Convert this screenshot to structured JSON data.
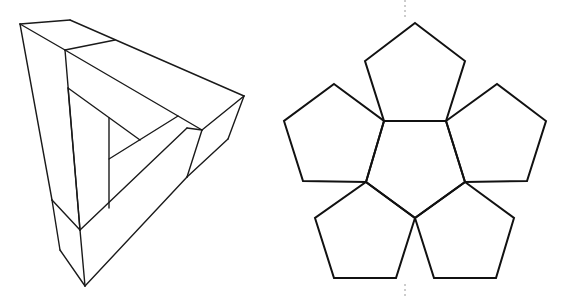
{
  "figure": {
    "width": 569,
    "height": 296,
    "line_color": "#1a1a1a",
    "background": "#ffffff"
  },
  "left_figure": {
    "name": "impossible-triangle",
    "segments": [
      [
        20,
        24,
        70,
        20
      ],
      [
        20,
        24,
        65,
        50
      ],
      [
        70,
        20,
        244,
        96
      ],
      [
        65,
        50,
        115,
        40
      ],
      [
        65,
        50,
        202,
        130
      ],
      [
        20,
        24,
        52,
        200
      ],
      [
        65,
        50,
        80,
        230
      ],
      [
        244,
        96,
        202,
        130
      ],
      [
        244,
        96,
        228,
        139
      ],
      [
        202,
        130,
        187,
        177
      ],
      [
        228,
        139,
        187,
        177
      ],
      [
        68,
        88,
        140,
        140
      ],
      [
        68,
        88,
        80,
        230
      ],
      [
        109,
        118,
        109,
        208
      ],
      [
        109,
        159,
        178,
        116
      ],
      [
        80,
        230,
        187,
        128
      ],
      [
        187,
        128,
        202,
        130
      ],
      [
        52,
        200,
        80,
        230
      ],
      [
        52,
        200,
        60,
        250
      ],
      [
        60,
        250,
        85,
        286
      ],
      [
        80,
        230,
        85,
        286
      ],
      [
        85,
        286,
        187,
        177
      ]
    ]
  },
  "right_figure": {
    "name": "dodecahedron-half-net",
    "pentagons": [
      {
        "name": "center",
        "points": "384,121 446,121 465,182 415,218 366,182"
      },
      {
        "name": "top",
        "points": "415,23 465,61 446,121 384,121 365,61"
      },
      {
        "name": "upper-right",
        "points": "446,121 497,84 546,121 527,181 465,182"
      },
      {
        "name": "upper-left",
        "points": "334,84 384,121 366,182 303,181 284,121"
      },
      {
        "name": "lower-right",
        "points": "465,182 514,218 496,278 434,278 415,218"
      },
      {
        "name": "lower-left",
        "points": "366,182 415,218 396,278 334,278 315,218"
      }
    ],
    "dashed_guides": [
      {
        "x1": 405,
        "y1": 0,
        "x2": 405,
        "y2": 18
      },
      {
        "x1": 405,
        "y1": 284,
        "x2": 405,
        "y2": 296
      }
    ]
  }
}
